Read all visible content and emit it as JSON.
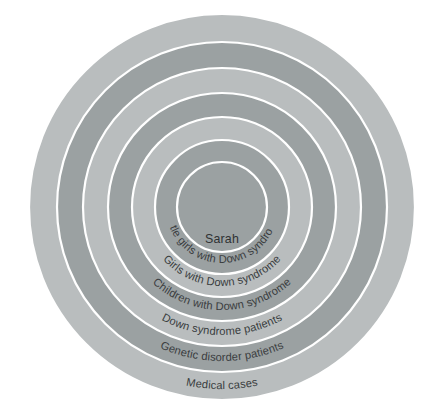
{
  "diagram": {
    "type": "nested-concentric-circles",
    "background_color": "#ffffff",
    "separator_color": "#ffffff",
    "center": {
      "x": 222,
      "y": 207
    },
    "outer_radius": 193,
    "label_text_color": "#3a3d3f",
    "levels": [
      {
        "index": 0,
        "label": "Medical cases",
        "radius": 193,
        "fill": "#b9bdbe",
        "tone": "light",
        "curved": true,
        "label_radius": 182
      },
      {
        "index": 1,
        "label": "Genetic disorder patients",
        "radius": 165,
        "fill": "#9ba1a2",
        "tone": "dark",
        "curved": true,
        "label_radius": 154
      },
      {
        "index": 2,
        "label": "Down syndrome patients",
        "radius": 139,
        "fill": "#b9bdbe",
        "tone": "light",
        "curved": true,
        "label_radius": 128
      },
      {
        "index": 3,
        "label": "Children with Down syndrome",
        "radius": 114,
        "fill": "#9ba1a2",
        "tone": "dark",
        "curved": true,
        "label_radius": 103
      },
      {
        "index": 4,
        "label": "Girls with Down syndrome",
        "radius": 90,
        "fill": "#b9bdbe",
        "tone": "light",
        "curved": true,
        "label_radius": 79
      },
      {
        "index": 5,
        "label": "Little girls with Down syndrome",
        "radius": 67,
        "fill": "#9ba1a2",
        "tone": "dark",
        "curved": true,
        "label_radius": 56
      },
      {
        "index": 6,
        "label": "Sarah",
        "radius": 45,
        "fill": "#9ba1a2",
        "tone": "dark",
        "curved": false,
        "label_radius": 0,
        "label_offset_y": 36
      }
    ]
  }
}
